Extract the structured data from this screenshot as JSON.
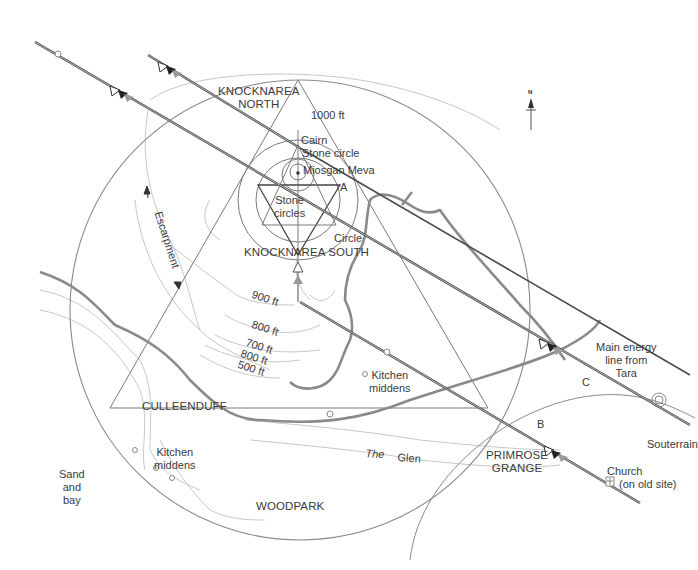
{
  "diagram": {
    "places": {
      "knocknarea_north": [
        "KNOCKNAREA",
        "NORTH"
      ],
      "knocknarea_south": "KNOCKNAREA SOUTH",
      "culleenduff": "CULLEENDUFF",
      "woodpark": "WOODPARK",
      "primrose_grange": [
        "PRIMROSE",
        "GRANGE"
      ]
    },
    "features": {
      "cairn": "Cairn",
      "stone_circle": "Stone circle",
      "miosgan_meva": "Miosgan Meva",
      "stone_circles": [
        "Stone",
        "circles"
      ],
      "circle": "Circle",
      "point_a": "A",
      "point_b": "B",
      "point_c": "C",
      "escarpment": "Escarpment",
      "kitchen_middens_1": [
        "Kitchen",
        "middens"
      ],
      "kitchen_middens_2": [
        "Kitchen",
        "middens"
      ],
      "sand_and_bay": [
        "Sand",
        "and",
        "bay"
      ],
      "the_glen": [
        "The",
        "Glen"
      ],
      "main_energy_line": [
        "Main energy",
        "line from",
        "Tara"
      ],
      "souterrain": "Souterrain",
      "church": [
        "Church",
        "(on old site)"
      ]
    },
    "contours": [
      "1000 ft",
      "900 ft",
      "800 ft",
      "700 ft",
      "800 ft",
      "500 ft"
    ],
    "compass": {
      "label": "N"
    },
    "colors": {
      "energy_line": "#4a4a4a",
      "road": "#8a8a8a",
      "geometry": "#7a7a7a",
      "contour": "#c4c4c4",
      "text": "#3a3a3a"
    }
  }
}
